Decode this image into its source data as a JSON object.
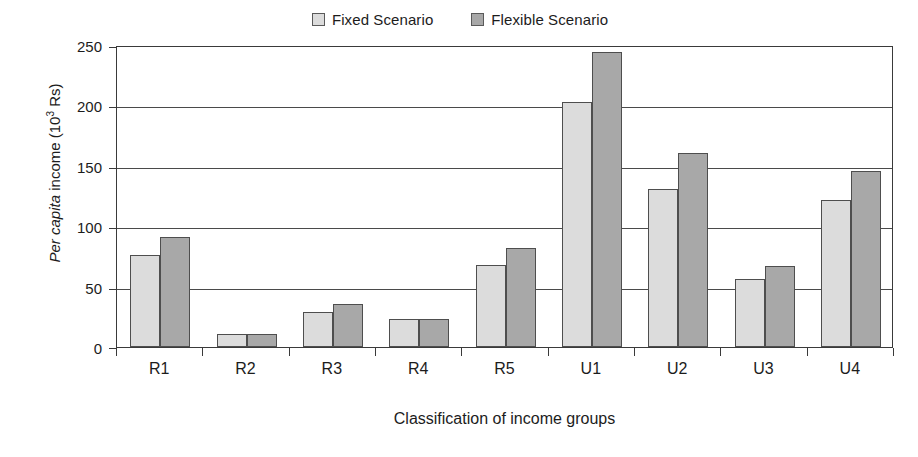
{
  "chart": {
    "legend": {
      "position": "top-center",
      "items": [
        {
          "label": "Fixed Scenario",
          "color": "#dcdcdc",
          "swatch_name": "legend-swatch-fixed"
        },
        {
          "label": "Flexible Scenario",
          "color": "#a8a8a8",
          "swatch_name": "legend-swatch-flexible"
        }
      ]
    },
    "y_axis": {
      "label_prefix": "Per capita",
      "label_middle": " income (10",
      "label_exponent": "3",
      "label_suffix": " Rs)",
      "ticks": [
        "250",
        "200",
        "150",
        "100",
        "50",
        "0"
      ]
    },
    "x_axis": {
      "title": "Classification of income groups"
    }
  },
  "chart_data": {
    "type": "bar",
    "title": "",
    "subtitle": "",
    "xlabel": "Classification of income groups",
    "ylabel": "Per capita income (10^3 Rs)",
    "ylim": [
      0,
      250
    ],
    "yticks": [
      0,
      50,
      100,
      150,
      200,
      250
    ],
    "grid": true,
    "legend_position": "top-center",
    "categories": [
      "R1",
      "R2",
      "R3",
      "R4",
      "R5",
      "U1",
      "U2",
      "U3",
      "U4"
    ],
    "series": [
      {
        "name": "Fixed Scenario",
        "color": "#dcdcdc",
        "values": [
          76,
          11,
          29,
          23,
          68,
          203,
          131,
          56,
          122
        ]
      },
      {
        "name": "Flexible Scenario",
        "color": "#a8a8a8",
        "values": [
          91,
          11,
          36,
          23,
          82,
          244,
          161,
          67,
          146
        ]
      }
    ]
  }
}
